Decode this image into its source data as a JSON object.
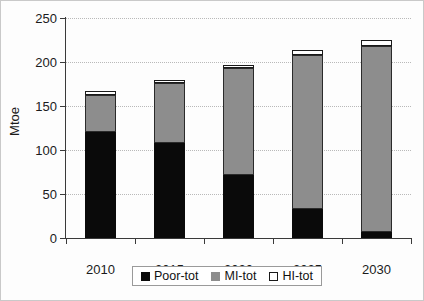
{
  "chart_data": {
    "type": "bar",
    "subtype": "stacked-column",
    "title": "",
    "xlabel": "",
    "ylabel": "Mtoe",
    "categories": [
      "2010",
      "2015",
      "2020",
      "2025",
      "2030"
    ],
    "ylim": [
      0,
      250
    ],
    "ytick_labels": [
      "0",
      "50",
      "100",
      "150",
      "200",
      "250"
    ],
    "ytick_values": [
      0,
      50,
      100,
      150,
      200,
      250
    ],
    "grid": "horizontal-dotted",
    "legend_position": "bottom-center",
    "series": [
      {
        "name": "Poor-tot",
        "color": "#0a0a0a",
        "values": [
          120,
          108,
          72,
          33,
          7
        ]
      },
      {
        "name": "MI-tot",
        "color": "#8d8d8d",
        "values": [
          43,
          68,
          121,
          175,
          211
        ]
      },
      {
        "name": "HI-tot",
        "color": "#ffffff",
        "values": [
          4,
          4,
          4,
          6,
          7
        ]
      }
    ],
    "totals": [
      167,
      180,
      197,
      214,
      225
    ]
  },
  "legend": {
    "items": [
      {
        "label": "Poor-tot",
        "swatch": "black-square-icon"
      },
      {
        "label": "MI-tot",
        "swatch": "gray-square-icon"
      },
      {
        "label": "HI-tot",
        "swatch": "white-square-icon"
      }
    ]
  }
}
